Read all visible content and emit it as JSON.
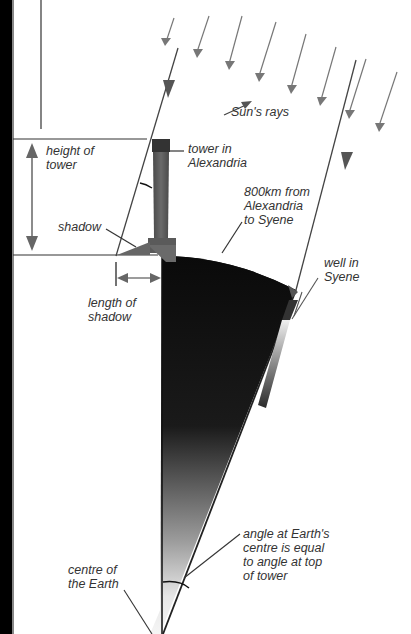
{
  "diagram": {
    "labels": {
      "sun_rays": "Sun's rays",
      "height_of_tower": "height of\ntower",
      "tower_in_alexandria": "tower in\nAlexandria",
      "distance": "800km from\nAlexandria\nto Syene",
      "shadow": "shadow",
      "well_in_syene": "well in\nSyene",
      "length_of_shadow": "length of\nshadow",
      "angle_note": "angle at Earth's\ncentre is equal\nto angle at top\nof tower",
      "centre_of_earth": "centre of\nthe Earth"
    },
    "colors": {
      "background": "#ffffff",
      "left_border": "#000000",
      "ray": "#555555",
      "ray_light": "#777777",
      "earth_dark": "#0d0d0d",
      "earth_light": "#f2f2f2",
      "tower": "#5a5a5a",
      "tower_top": "#333333",
      "text": "#333333",
      "dimension": "#666666"
    }
  }
}
